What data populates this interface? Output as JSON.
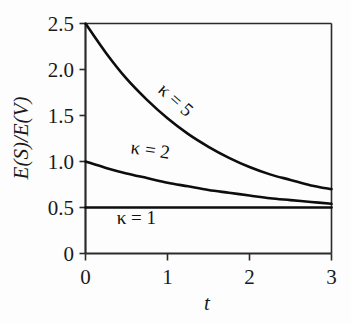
{
  "figure": {
    "background_color": "#fdfdfd",
    "axis_color": "#2b2b2b",
    "curve_color": "#0d0d0d"
  },
  "chart_data": {
    "type": "line",
    "title": "",
    "subtitle": "",
    "xlabel": "t",
    "ylabel": "E(S)/E(V)",
    "xlim": [
      0,
      3
    ],
    "ylim": [
      0,
      2.5
    ],
    "xticks": [
      0,
      1,
      2,
      3
    ],
    "xtick_labels": [
      "0",
      "1",
      "2",
      "3"
    ],
    "yticks": [
      0,
      0.5,
      1.0,
      1.5,
      2.0,
      2.5
    ],
    "ytick_labels": [
      "0",
      "0.5",
      "1.0",
      "1.5",
      "2.0",
      "2.5"
    ],
    "grid": false,
    "legend_position": "inline-curve-labels",
    "x": [
      0,
      0.25,
      0.5,
      0.75,
      1.0,
      1.25,
      1.5,
      1.75,
      2.0,
      2.25,
      2.5,
      2.75,
      3.0
    ],
    "series": [
      {
        "name": "kappa = 5",
        "label": "κ = 5",
        "kappa": 5,
        "y0": 2.5,
        "y_end": 0.7,
        "asymptote": 0.5,
        "values": [
          2.5,
          2.18,
          1.9,
          1.67,
          1.47,
          1.3,
          1.16,
          1.04,
          0.94,
          0.86,
          0.8,
          0.74,
          0.7
        ],
        "annotation": {
          "text": "κ = 5",
          "x_data": 1.05,
          "y_data": 1.62,
          "rotation_deg": 42
        }
      },
      {
        "name": "kappa = 2",
        "label": "κ = 2",
        "kappa": 2,
        "y0": 1.0,
        "y_end": 0.54,
        "asymptote": 0.5,
        "values": [
          1.0,
          0.93,
          0.87,
          0.82,
          0.77,
          0.73,
          0.69,
          0.66,
          0.63,
          0.6,
          0.58,
          0.56,
          0.54
        ],
        "annotation": {
          "text": "κ = 2",
          "x_data": 0.78,
          "y_data": 1.06,
          "rotation_deg": 8
        }
      },
      {
        "name": "kappa = 1",
        "label": "κ = 1",
        "kappa": 1,
        "y0": 0.5,
        "y_end": 0.5,
        "asymptote": 0.5,
        "values": [
          0.5,
          0.5,
          0.5,
          0.5,
          0.5,
          0.5,
          0.5,
          0.5,
          0.5,
          0.5,
          0.5,
          0.5,
          0.5
        ],
        "annotation": {
          "text": "κ = 1",
          "x_data": 0.62,
          "y_data": 0.32,
          "rotation_deg": 0
        }
      }
    ]
  },
  "labels": {
    "y_axis_title": "E(S)/E(V)",
    "x_axis_title": "t",
    "ytick_0": "0",
    "ytick_05": "0.5",
    "ytick_10": "1.0",
    "ytick_15": "1.5",
    "ytick_20": "2.0",
    "ytick_25": "2.5",
    "xtick_0": "0",
    "xtick_1": "1",
    "xtick_2": "2",
    "xtick_3": "3",
    "curve_label_k5": "κ = 5",
    "curve_label_k2": "κ = 2",
    "curve_label_k1": "κ = 1"
  }
}
